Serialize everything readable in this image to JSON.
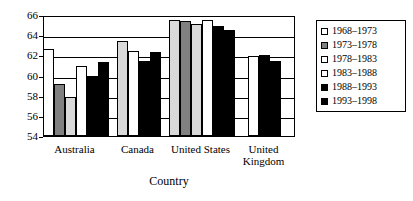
{
  "chart_data": {
    "type": "bar",
    "title": "",
    "xlabel": "Country",
    "ylabel": "",
    "ylim": [
      54,
      66
    ],
    "ytick_step": 2,
    "yticks": [
      "66",
      "64",
      "62",
      "60",
      "58",
      "56",
      "54"
    ],
    "grid": true,
    "legend_position": "right-outside",
    "categories": [
      "Australia",
      "Canada",
      "United States",
      "United Kingdom"
    ],
    "category_labels": [
      {
        "line1": "Australia",
        "line2": ""
      },
      {
        "line1": "Canada",
        "line2": ""
      },
      {
        "line1": "United States",
        "line2": ""
      },
      {
        "line1": "United",
        "line2": "Kingdom"
      }
    ],
    "series": [
      {
        "name": "1968–1973",
        "fill": "white",
        "color": "#ffffff",
        "values": [
          62.6,
          null,
          null,
          null
        ]
      },
      {
        "name": "1973–1978",
        "fill": "gray",
        "color": "#808080",
        "values": [
          59.2,
          null,
          65.4,
          null
        ]
      },
      {
        "name": "1978–1983",
        "fill": "ltgray",
        "color": "#d9d9d9",
        "values": [
          57.9,
          63.4,
          65.1,
          null
        ]
      },
      {
        "name": "1983–1988",
        "fill": "white",
        "color": "#ffffff",
        "values": [
          60.9,
          62.4,
          65.5,
          61.9
        ]
      },
      {
        "name": "1988–1993",
        "fill": "black",
        "color": "#000000",
        "values": [
          60.0,
          61.4,
          64.9,
          62.0
        ]
      },
      {
        "name": "1993–1998",
        "fill": "black",
        "color": "#000000",
        "values": [
          61.3,
          62.3,
          64.5,
          61.4
        ]
      }
    ],
    "us_first_bar": {
      "name": "1968–1973",
      "fill": "ltgray",
      "value": 65.5
    }
  },
  "legend": {
    "items": [
      {
        "label": "1968–1973",
        "fill": "white"
      },
      {
        "label": "1973–1978",
        "fill": "gray"
      },
      {
        "label": "1978–1983",
        "fill": "white"
      },
      {
        "label": "1983–1988",
        "fill": "white"
      },
      {
        "label": "1988–1993",
        "fill": "black"
      },
      {
        "label": "1993–1998",
        "fill": "black"
      }
    ]
  }
}
